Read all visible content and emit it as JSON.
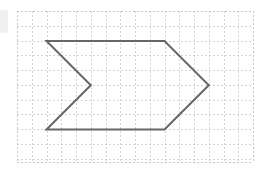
{
  "diagram": {
    "type": "shape-on-grid",
    "shape_name": "chevron-arrow",
    "grid": {
      "origin_px": [
        17,
        11
      ],
      "cell_px": 14.75,
      "columns": 16,
      "rows": 10,
      "line_color": "#c8c8c8",
      "border_color": "#bbbbbb"
    },
    "shape": {
      "stroke_color": "#666666",
      "stroke_width": 2,
      "vertices_grid": [
        [
          2,
          2
        ],
        [
          10,
          2
        ],
        [
          13,
          5
        ],
        [
          10,
          8
        ],
        [
          2,
          8
        ],
        [
          5,
          5
        ]
      ]
    }
  }
}
